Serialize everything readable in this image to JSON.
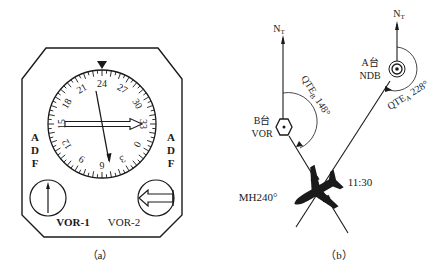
{
  "colors": {
    "ink": "#1a1a1a",
    "background": "#ffffff"
  },
  "panel_a": {
    "caption": "（a）",
    "heading_deg": 240,
    "compass_labels": [
      {
        "text": "24",
        "deg": 240
      },
      {
        "text": "27",
        "deg": 270
      },
      {
        "text": "30",
        "deg": 300
      },
      {
        "text": "33",
        "deg": 330
      },
      {
        "text": "0",
        "deg": 0
      },
      {
        "text": "3",
        "deg": 30
      },
      {
        "text": "6",
        "deg": 60
      },
      {
        "text": "9",
        "deg": 90
      },
      {
        "text": "12",
        "deg": 120
      },
      {
        "text": "15",
        "deg": 150
      },
      {
        "text": "18",
        "deg": 180
      },
      {
        "text": "21",
        "deg": 210
      }
    ],
    "left_switch": {
      "letters": [
        "A",
        "D",
        "F"
      ],
      "label": "VOR-1",
      "icon": "single-needle-arrow-up"
    },
    "right_switch": {
      "letters": [
        "A",
        "D",
        "F"
      ],
      "label": "VOR-2",
      "icon": "double-arrow-left"
    },
    "double_needle_points_to": "33",
    "single_needle_points_to": "9",
    "lubber_icon": "triangle-down"
  },
  "panel_b": {
    "caption": "（b）",
    "north_label_main": "N",
    "north_label_sub": "T",
    "station_b": {
      "name": "B台",
      "type": "VOR",
      "qte_label": "QTE",
      "qte_sub": "B",
      "qte_value": "148°"
    },
    "station_a": {
      "name": "A台",
      "type": "NDB",
      "qte_label": "QTE",
      "qte_sub": "A",
      "qte_value": "228°"
    },
    "aircraft": {
      "heading_label": "MH240°",
      "time": "11:30"
    }
  }
}
